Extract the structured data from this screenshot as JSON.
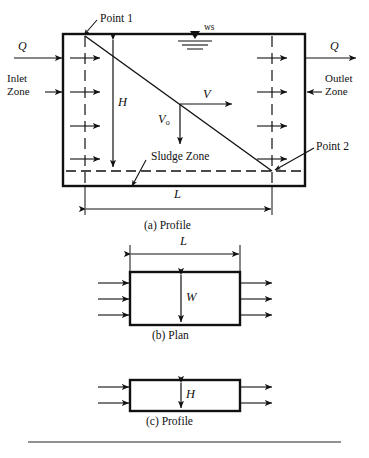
{
  "figure": {
    "title_implicit": "Sedimentation basin definition sketch",
    "background_color": "#ffffff",
    "line_color": "#111111",
    "panels": [
      {
        "id": "panel-a",
        "caption": "(a)  Profile",
        "labels": {
          "inflow": "Q",
          "outflow": "Q",
          "inlet_zone": [
            "Inlet",
            "Zone"
          ],
          "outlet_zone": [
            "Outlet",
            "Zone"
          ],
          "water_surface": "ws",
          "point_1": "Point 1",
          "point_2": "Point 2",
          "depth": "H",
          "length": "L",
          "velocity_horizontal": "V",
          "velocity_settling_base": "V",
          "velocity_settling_sub": "o",
          "sludge_zone": "Sludge Zone"
        }
      },
      {
        "id": "panel-b",
        "caption": "(b)  Plan",
        "labels": {
          "length": "L",
          "width": "W"
        },
        "inlet_arrow_count": 3,
        "outlet_arrow_count": 3
      },
      {
        "id": "panel-c",
        "caption": "(c)  Profile",
        "labels": {
          "depth": "H"
        },
        "inlet_arrow_count": 2,
        "outlet_arrow_count": 2
      }
    ]
  }
}
